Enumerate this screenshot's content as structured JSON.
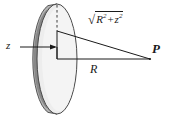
{
  "figure": {
    "name": "charged-disk-axial-point-diagram",
    "background_color": "#ffffff",
    "stroke_color": "#1a1a1a",
    "disk": {
      "face_color": "#ececec",
      "rim_color": "#9a9a9a",
      "rim_shadow_color": "#6e6e6e",
      "center_x": 57,
      "center_y": 59,
      "radius_x": 20,
      "radius_y": 55,
      "thickness": 9
    },
    "labels": {
      "axis_distance": "z",
      "disk_radius": "R",
      "field_point": "P",
      "hypotenuse": {
        "radical": "√",
        "term1_base": "R",
        "term1_exp": "2",
        "operator": "+",
        "term2_base": "z",
        "term2_exp": "2"
      }
    },
    "points": {
      "disk_center": [
        57,
        59
      ],
      "disk_top_edge": [
        57,
        5
      ],
      "triangle_apex": [
        57,
        31
      ],
      "field_point_P": [
        150,
        59
      ],
      "arrow_tail": [
        22,
        47
      ],
      "arrow_head": [
        57,
        47
      ]
    },
    "geometry_notes": {
      "dashed_line": "disk center axis from top edge of disk to triangle apex",
      "hypotenuse_line": "from triangle apex to field point P",
      "base_line": "from disk center to field point P labelled R"
    }
  }
}
